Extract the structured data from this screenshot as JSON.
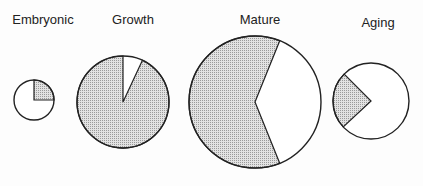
{
  "chart_data": {
    "type": "pie",
    "title": "",
    "categories": [
      "Embryonic",
      "Growth",
      "Mature",
      "Aging"
    ],
    "series": [
      {
        "name": "Shaded share (%)",
        "values": [
          25,
          93,
          62,
          25
        ]
      },
      {
        "name": "Unshaded share (%)",
        "values": [
          75,
          7,
          38,
          75
        ]
      }
    ],
    "relative_size_radius_px": [
      20,
      46,
      66,
      38
    ],
    "shaded_color": "#c8c8c8",
    "unshaded_color": "#ffffff"
  },
  "pies": [
    {
      "label": "Embryonic",
      "cx": 34,
      "cy": 100,
      "r": 20,
      "shade_start_deg": 0,
      "shade_end_deg": 90,
      "label_x": 43,
      "label_y": 24
    },
    {
      "label": "Growth",
      "cx": 123,
      "cy": 102,
      "r": 46,
      "shade_start_deg": 25,
      "shade_end_deg": 360,
      "label_x": 133,
      "label_y": 24
    },
    {
      "label": "Mature",
      "cx": 255,
      "cy": 102,
      "r": 66,
      "shade_start_deg": 158,
      "shade_end_deg": 382,
      "label_x": 260,
      "label_y": 24
    },
    {
      "label": "Aging",
      "cx": 371,
      "cy": 101,
      "r": 38,
      "shade_start_deg": 227,
      "shade_end_deg": 315,
      "label_x": 378,
      "label_y": 27
    }
  ]
}
